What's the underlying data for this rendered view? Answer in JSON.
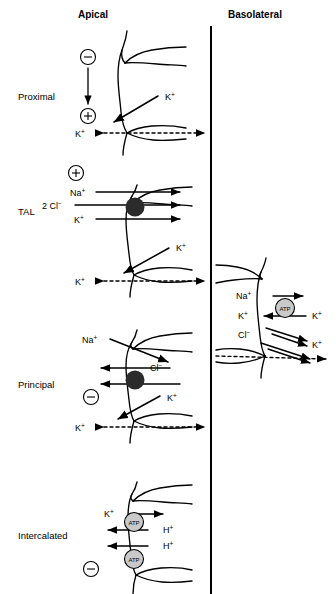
{
  "figure": {
    "type": "physiology-transport-diagram",
    "headers": {
      "apical": "Apical",
      "basolateral": "Basolateral"
    },
    "divider": {
      "name": "vertical-divider",
      "x": 211,
      "color": "#000000"
    }
  },
  "segments": [
    {
      "id": "proximal",
      "label": "Proximal",
      "label_xy": [
        18,
        100
      ],
      "charge_markers": [
        {
          "sign": "−",
          "cx": 88,
          "cy": 57
        },
        {
          "sign": "+",
          "cx": 88,
          "cy": 116
        }
      ],
      "voltage_arrow": {
        "x": 88,
        "y1": 68,
        "y2": 106
      },
      "ions": [
        {
          "text": "K",
          "charge": "+",
          "x": 165,
          "y": 100,
          "name": "k-plus-channel-label"
        },
        {
          "text": "K",
          "charge": "+",
          "x": 88,
          "y": 137,
          "name": "k-plus-paracellular-label"
        }
      ]
    },
    {
      "id": "tal",
      "label": "TAL",
      "label_xy": [
        18,
        215
      ],
      "charge_markers": [
        {
          "sign": "+",
          "cx": 76,
          "cy": 173
        }
      ],
      "ions": [
        {
          "text": "Na",
          "charge": "+",
          "x": 78,
          "y": 194,
          "name": "na-plus-nkcc-label"
        },
        {
          "text": "2 Cl",
          "charge": "−",
          "x": 50,
          "y": 207,
          "name": "cl-minus-nkcc-label"
        },
        {
          "text": "K",
          "charge": "+",
          "x": 80,
          "y": 221,
          "name": "k-plus-nkcc-label"
        },
        {
          "text": "K",
          "charge": "+",
          "x": 176,
          "y": 251,
          "name": "k-plus-romk-label"
        },
        {
          "text": "K",
          "charge": "+",
          "x": 88,
          "y": 282,
          "name": "k-plus-paracellular-label"
        }
      ],
      "transporter": {
        "name": "nkcc2-transporter",
        "cx": 135,
        "cy": 207,
        "r": 9,
        "fill": "#2b2b2b"
      }
    },
    {
      "id": "principal",
      "label": "Principal",
      "label_xy": [
        18,
        388
      ],
      "charge_markers": [
        {
          "sign": "−",
          "cx": 91,
          "cy": 397
        }
      ],
      "ions": [
        {
          "text": "Na",
          "charge": "+",
          "x": 98,
          "y": 343,
          "name": "na-plus-enac-label"
        },
        {
          "text": "Cl",
          "charge": "−",
          "x": 143,
          "y": 368,
          "name": "cl-minus-label"
        },
        {
          "text": "K",
          "charge": "+",
          "x": 165,
          "y": 401,
          "name": "k-plus-romk-label"
        },
        {
          "text": "K",
          "charge": "+",
          "x": 88,
          "y": 427,
          "name": "k-plus-paracellular-label"
        }
      ],
      "transporter": {
        "name": "chloride-transporter",
        "cx": 135,
        "cy": 380,
        "r": 9,
        "fill": "#2b2b2b"
      }
    },
    {
      "id": "intercalated",
      "label": "Intercalated",
      "label_xy": [
        18,
        539
      ],
      "charge_markers": [
        {
          "sign": "−",
          "cx": 91,
          "cy": 569
        }
      ],
      "ions": [
        {
          "text": "K",
          "charge": "+",
          "x": 112,
          "y": 517,
          "name": "k-plus-hk-atpase-label"
        },
        {
          "text": "H",
          "charge": "+",
          "x": 161,
          "y": 533,
          "name": "h-plus-hk-atpase-label"
        },
        {
          "text": "H",
          "charge": "+",
          "x": 161,
          "y": 549,
          "name": "h-plus-h-atpase-label"
        }
      ],
      "pumps": [
        {
          "name": "hk-atpase-pump",
          "label": "ATP",
          "cx": 134,
          "cy": 522,
          "r": 9
        },
        {
          "name": "h-atpase-pump",
          "label": "ATP",
          "cx": 134,
          "cy": 559,
          "r": 9
        }
      ]
    },
    {
      "id": "basolateral-cell",
      "label": "",
      "label_xy": [
        0,
        0
      ],
      "charge_markers": [],
      "ions": [
        {
          "text": "Na",
          "charge": "+",
          "x": 243,
          "y": 299,
          "name": "na-plus-nka-label"
        },
        {
          "text": "K",
          "charge": "+",
          "x": 243,
          "y": 317,
          "name": "k-plus-nka-label"
        },
        {
          "text": "Cl",
          "charge": "−",
          "x": 243,
          "y": 334,
          "name": "cl-minus-label"
        },
        {
          "text": "K",
          "charge": "+",
          "x": 318,
          "y": 317,
          "name": "k-plus-in-label"
        },
        {
          "text": "K",
          "charge": "+",
          "x": 318,
          "y": 345,
          "name": "k-plus-out-label"
        }
      ],
      "pumps": [
        {
          "name": "na-k-atpase-pump",
          "label": "ATP",
          "cx": 285,
          "cy": 308,
          "r": 9.5
        }
      ]
    }
  ],
  "colors": {
    "line": "#000000",
    "transporter_fill": "#2b2b2b",
    "atp_fill": "#c9c9c9",
    "background": "#ffffff"
  }
}
